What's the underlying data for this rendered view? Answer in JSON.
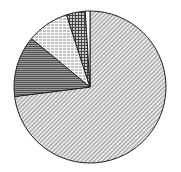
{
  "chart_data": {
    "type": "pie",
    "title": "",
    "categories": [
      "Slice A",
      "Slice B",
      "Slice C",
      "Slice D",
      "Slice E"
    ],
    "values": [
      73,
      13,
      9,
      4,
      1
    ],
    "start_angle_deg": 0,
    "direction": "clockwise",
    "legend": "none",
    "patterns": [
      "diagonal-hatch",
      "dense-horizontal-dark",
      "light-horizontal-hatch",
      "cross-hatch",
      "white"
    ]
  }
}
